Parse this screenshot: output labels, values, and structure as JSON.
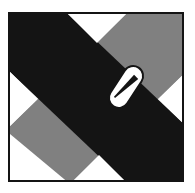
{
  "figure": {
    "canvas": {
      "width": 195,
      "height": 193,
      "background_color": "#ffffff"
    },
    "frame": {
      "x": 8,
      "y": 12,
      "width": 176,
      "height": 170,
      "border_color": "#141414",
      "border_width": 2,
      "fill_color": "#ffffff"
    },
    "colors": {
      "black": "#141414",
      "gray": "#808080",
      "white": "#ffffff",
      "outline": "#141414"
    },
    "bands": [
      {
        "name": "gray-band",
        "label": "Gray diagonal band",
        "direction": "bottom-left to top-right",
        "color": "#808080",
        "z_order": 1,
        "points": "0,120 60,170 176,58 176,0 116,0 0,112"
      },
      {
        "name": "black-band",
        "label": "Black diagonal band",
        "direction": "top-left to bottom-right",
        "color": "#141414",
        "z_order": 2,
        "points": "0,0 0,58 118,170 176,170 176,112 58,0"
      }
    ],
    "triangles": [
      {
        "name": "white-triangle-north",
        "label": "North white triangle",
        "color": "#ffffff",
        "points": "58,0 116,0 87,29"
      },
      {
        "name": "white-triangle-west",
        "label": "West white triangle",
        "color": "#ffffff",
        "points": "0,58 0,112 27,85"
      },
      {
        "name": "white-triangle-south",
        "label": "South white triangle",
        "color": "#ffffff",
        "points": "60,170 118,170 89,141"
      },
      {
        "name": "white-triangle-east",
        "label": "East white triangle",
        "color": "#ffffff",
        "points": "176,58 176,112 149,85"
      }
    ],
    "marker": {
      "name": "capsule-marker",
      "label": "Capsule marker",
      "shape": "rounded-capsule",
      "center_x": 116,
      "center_y": 73,
      "length": 46,
      "thickness": 20,
      "corner_radius": 10,
      "rotation_deg": -57,
      "fill_color": "#ffffff",
      "outline_color": "#141414",
      "outline_width": 2,
      "inner_stroke": {
        "name": "capsule-inner-stroke",
        "label": "Inner diagonal stroke",
        "color": "#141414",
        "x1": -15,
        "y1": -4,
        "x2": 14,
        "y2": 3,
        "width_start": 1.5,
        "width_end": 6
      }
    }
  }
}
